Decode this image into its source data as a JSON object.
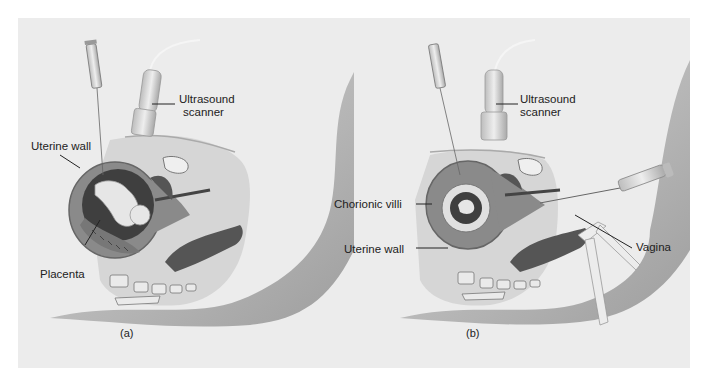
{
  "figure": {
    "panels": [
      {
        "id": "a",
        "caption": "(a)",
        "labels": {
          "ultrasound_line1": "Ultrasound",
          "ultrasound_line2": "scanner",
          "uterine_wall": "Uterine wall",
          "placenta": "Placenta"
        }
      },
      {
        "id": "b",
        "caption": "(b)",
        "labels": {
          "ultrasound_line1": "Ultrasound",
          "ultrasound_line2": "scanner",
          "chorionic_villi": "Chorionic villi",
          "uterine_wall": "Uterine wall",
          "vagina": "Vagina"
        }
      }
    ],
    "colors": {
      "background": "#ececec",
      "body": "#c9c9c9",
      "body_shadow": "#a8a8a8",
      "uterus": "#8a8a8a",
      "uterus_dark": "#5e5e5e",
      "cavity": "#3d3d3d",
      "fetus": "#e6e6e6",
      "instrument": "#d9d9d9"
    }
  }
}
